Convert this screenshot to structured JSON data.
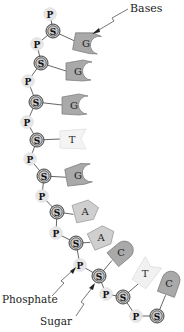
{
  "labels": {
    "bases": "Bases",
    "phosphate": "Phosphate",
    "sugar": "Sugar"
  },
  "node_letters": {
    "phosphate": "P",
    "sugar": "S"
  },
  "colors": {
    "base_dark": "#a9a9a9",
    "base_light": "#cfcfcf",
    "base_faded": "#f1f1f1",
    "phosphate_fill": "#e6e6e6",
    "sugar_fill": "#c8c8c8",
    "line": "#555555"
  },
  "backbone": [
    {
      "type": "P",
      "x": 50,
      "y": 14
    },
    {
      "type": "S",
      "x": 53,
      "y": 31
    },
    {
      "type": "P",
      "x": 37,
      "y": 44
    },
    {
      "type": "S",
      "x": 41,
      "y": 63
    },
    {
      "type": "P",
      "x": 28,
      "y": 81
    },
    {
      "type": "S",
      "x": 36,
      "y": 102
    },
    {
      "type": "P",
      "x": 27,
      "y": 122
    },
    {
      "type": "S",
      "x": 37,
      "y": 140
    },
    {
      "type": "P",
      "x": 30,
      "y": 159
    },
    {
      "type": "S",
      "x": 44,
      "y": 176
    },
    {
      "type": "P",
      "x": 42,
      "y": 196
    },
    {
      "type": "S",
      "x": 57,
      "y": 212
    },
    {
      "type": "P",
      "x": 56,
      "y": 233
    },
    {
      "type": "S",
      "x": 76,
      "y": 243
    },
    {
      "type": "P",
      "x": 80,
      "y": 265
    },
    {
      "type": "S",
      "x": 99,
      "y": 276
    },
    {
      "type": "P",
      "x": 106,
      "y": 294
    },
    {
      "type": "S",
      "x": 123,
      "y": 297
    },
    {
      "type": "P",
      "x": 136,
      "y": 316
    },
    {
      "type": "S",
      "x": 157,
      "y": 316
    }
  ],
  "bases": [
    {
      "letter": "G",
      "shape": "G",
      "x": 87,
      "y": 43,
      "rot": 10,
      "sugar": 1
    },
    {
      "letter": "G",
      "shape": "G",
      "x": 79,
      "y": 71,
      "rot": 0,
      "sugar": 3
    },
    {
      "letter": "G",
      "shape": "G",
      "x": 75,
      "y": 105,
      "rot": 0,
      "sugar": 5
    },
    {
      "letter": "T",
      "shape": "T",
      "x": 73,
      "y": 139,
      "rot": 0,
      "sugar": 7
    },
    {
      "letter": "G",
      "shape": "G",
      "x": 79,
      "y": 175,
      "rot": -10,
      "sugar": 9
    },
    {
      "letter": "A",
      "shape": "A",
      "x": 86,
      "y": 211,
      "rot": -15,
      "sugar": 11
    },
    {
      "letter": "A",
      "shape": "A",
      "x": 102,
      "y": 237,
      "rot": -25,
      "sugar": 13
    },
    {
      "letter": "C",
      "shape": "C",
      "x": 122,
      "y": 252,
      "rot": -40,
      "sugar": 15
    },
    {
      "letter": "T",
      "shape": "T",
      "x": 146,
      "y": 273,
      "rot": -55,
      "sugar": 17
    },
    {
      "letter": "C",
      "shape": "C",
      "x": 170,
      "y": 283,
      "rot": -70,
      "sugar": 19
    }
  ]
}
